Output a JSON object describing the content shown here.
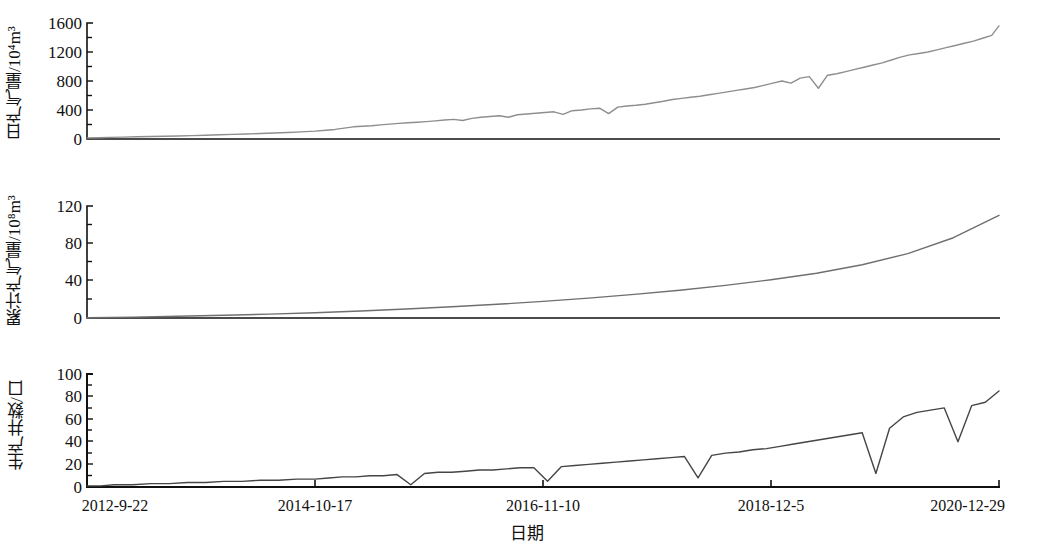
{
  "figure": {
    "xaxis_title": "日期",
    "x_tick_labels": [
      "2012-9-22",
      "2014-10-17",
      "2016-11-10",
      "2018-12-5",
      "2020-12-29"
    ],
    "panels": [
      {
        "id": "daily",
        "ylabel_main": "日产气量/10",
        "ylabel_exp": "4",
        "ylabel_tail": "m",
        "ylabel_tail_exp": "3",
        "ylabel_full": "日产气量/10⁴m³",
        "y_tick_labels": [
          "1600",
          "1200",
          "800",
          "400",
          "0"
        ]
      },
      {
        "id": "cumulative",
        "ylabel_full": "累计产气量/10⁸m³",
        "y_tick_labels": [
          "120",
          "80",
          "40",
          "0"
        ]
      },
      {
        "id": "wells",
        "ylabel_full": "生产井数/口",
        "y_tick_labels": [
          "100",
          "80",
          "60",
          "40",
          "20",
          "0"
        ]
      }
    ]
  },
  "chart_data": [
    {
      "type": "line",
      "title": "日产气量",
      "xlabel": "日期",
      "ylabel": "日产气量/10⁴m³",
      "ylim": [
        0,
        1600
      ],
      "yticks": [
        0,
        400,
        800,
        1200,
        1600
      ],
      "grid": false,
      "legend": "none",
      "color": "#8e8e8e",
      "x_range": [
        "2012-9-22",
        "2020-12-29"
      ],
      "x_tick_labels": [
        "2012-9-22",
        "2014-10-17",
        "2016-11-10",
        "2018-12-5",
        "2020-12-29"
      ],
      "x": [
        0,
        0.012,
        0.025,
        0.04,
        0.055,
        0.07,
        0.085,
        0.1,
        0.115,
        0.13,
        0.145,
        0.16,
        0.175,
        0.19,
        0.205,
        0.22,
        0.235,
        0.25,
        0.262,
        0.272,
        0.282,
        0.292,
        0.302,
        0.312,
        0.322,
        0.332,
        0.342,
        0.352,
        0.362,
        0.372,
        0.382,
        0.392,
        0.402,
        0.412,
        0.422,
        0.432,
        0.442,
        0.452,
        0.462,
        0.472,
        0.482,
        0.492,
        0.502,
        0.512,
        0.522,
        0.532,
        0.542,
        0.552,
        0.562,
        0.572,
        0.582,
        0.592,
        0.602,
        0.612,
        0.622,
        0.632,
        0.642,
        0.652,
        0.662,
        0.672,
        0.682,
        0.692,
        0.702,
        0.712,
        0.722,
        0.732,
        0.742,
        0.752,
        0.762,
        0.772,
        0.782,
        0.792,
        0.802,
        0.812,
        0.822,
        0.832,
        0.842,
        0.852,
        0.862,
        0.872,
        0.882,
        0.892,
        0.902,
        0.912,
        0.922,
        0.932,
        0.942,
        0.952,
        0.962,
        0.972,
        0.982,
        0.992,
        1.0
      ],
      "values": [
        15,
        18,
        22,
        26,
        30,
        34,
        38,
        42,
        46,
        52,
        58,
        64,
        70,
        76,
        82,
        90,
        98,
        108,
        120,
        132,
        150,
        168,
        175,
        182,
        195,
        205,
        215,
        225,
        232,
        240,
        250,
        262,
        270,
        255,
        285,
        300,
        310,
        320,
        300,
        335,
        345,
        355,
        365,
        375,
        340,
        390,
        400,
        415,
        425,
        350,
        440,
        455,
        465,
        480,
        500,
        520,
        545,
        560,
        575,
        590,
        610,
        630,
        650,
        670,
        690,
        710,
        740,
        770,
        800,
        770,
        840,
        860,
        700,
        880,
        900,
        930,
        960,
        990,
        1020,
        1050,
        1090,
        1130,
        1160,
        1180,
        1200,
        1230,
        1260,
        1290,
        1320,
        1350,
        1390,
        1430,
        1560
      ]
    },
    {
      "type": "line",
      "title": "累计产气量",
      "xlabel": "日期",
      "ylabel": "累计产气量/10⁸m³",
      "ylim": [
        0,
        120
      ],
      "yticks": [
        0,
        40,
        80,
        120
      ],
      "grid": false,
      "legend": "none",
      "color": "#6f6f6f",
      "x_range": [
        "2012-9-22",
        "2020-12-29"
      ],
      "x": [
        0,
        0.05,
        0.1,
        0.15,
        0.2,
        0.25,
        0.3,
        0.35,
        0.4,
        0.45,
        0.5,
        0.55,
        0.6,
        0.65,
        0.7,
        0.75,
        0.8,
        0.85,
        0.9,
        0.95,
        1.0
      ],
      "values": [
        0.3,
        0.9,
        1.8,
        2.9,
        4.2,
        5.7,
        7.5,
        9.6,
        12.0,
        14.7,
        17.8,
        21.3,
        25.3,
        29.8,
        35.0,
        41.0,
        48.0,
        57.0,
        69.0,
        86.0,
        110.0
      ]
    },
    {
      "type": "line",
      "title": "生产井数",
      "xlabel": "日期",
      "ylabel": "生产井数/口",
      "ylim": [
        0,
        100
      ],
      "yticks": [
        0,
        20,
        40,
        60,
        80,
        100
      ],
      "grid": false,
      "legend": "none",
      "color": "#454545",
      "x_range": [
        "2012-9-22",
        "2020-12-29"
      ],
      "x": [
        0,
        0.015,
        0.03,
        0.05,
        0.07,
        0.09,
        0.11,
        0.13,
        0.15,
        0.17,
        0.19,
        0.21,
        0.23,
        0.25,
        0.265,
        0.28,
        0.295,
        0.31,
        0.325,
        0.34,
        0.355,
        0.37,
        0.385,
        0.4,
        0.415,
        0.43,
        0.445,
        0.46,
        0.475,
        0.49,
        0.505,
        0.52,
        0.535,
        0.55,
        0.565,
        0.58,
        0.595,
        0.61,
        0.625,
        0.64,
        0.655,
        0.67,
        0.685,
        0.7,
        0.715,
        0.73,
        0.745,
        0.76,
        0.775,
        0.79,
        0.805,
        0.82,
        0.835,
        0.85,
        0.865,
        0.88,
        0.895,
        0.91,
        0.925,
        0.94,
        0.955,
        0.97,
        0.985,
        1.0
      ],
      "values": [
        1,
        1,
        2,
        2,
        3,
        3,
        4,
        4,
        5,
        5,
        6,
        6,
        7,
        7,
        8,
        9,
        9,
        10,
        10,
        11,
        2,
        12,
        13,
        13,
        14,
        15,
        15,
        16,
        17,
        17,
        5,
        18,
        19,
        20,
        21,
        22,
        23,
        24,
        25,
        26,
        27,
        8,
        28,
        30,
        31,
        33,
        34,
        36,
        38,
        40,
        42,
        44,
        46,
        48,
        12,
        52,
        62,
        66,
        68,
        70,
        40,
        72,
        75,
        85
      ]
    }
  ]
}
